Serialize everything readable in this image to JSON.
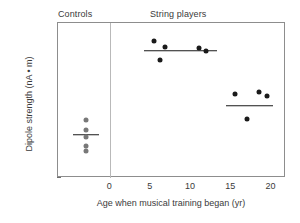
{
  "headers": {
    "controls": "Controls",
    "string_players": "String players"
  },
  "axis": {
    "ylabel": "Dipole strength (nA • m)",
    "xlabel": "Age when musical training began (yr)",
    "yticks": [
      "0",
      "5",
      "10",
      "15",
      "20",
      "25",
      "30"
    ],
    "xticks": [
      "0",
      "5",
      "10",
      "15",
      "20"
    ]
  },
  "chart_data": {
    "type": "scatter",
    "title": "",
    "xlabel": "Age when musical training began (yr)",
    "ylabel": "Dipole strength (nA • m)",
    "xlim": [
      -6.5,
      21.8
    ],
    "ylim": [
      0,
      30
    ],
    "xticks": [
      0,
      5,
      10,
      15,
      20
    ],
    "yticks": [
      0,
      5,
      10,
      15,
      20,
      25,
      30
    ],
    "grid": false,
    "legend": null,
    "group_divider_x": 0,
    "series": [
      {
        "name": "Controls",
        "color": "#787878",
        "points": [
          {
            "x": -3.0,
            "y": 11.2
          },
          {
            "x": -3.0,
            "y": 9.3
          },
          {
            "x": -3.0,
            "y": 8.0
          },
          {
            "x": -3.0,
            "y": 6.2
          },
          {
            "x": -3.0,
            "y": 5.2
          }
        ],
        "mean": 8.4,
        "mean_line_x": [
          -4.6,
          -1.4
        ]
      },
      {
        "name": "String players (early training)",
        "color": "#1a1a1a",
        "points": [
          {
            "x": 5.4,
            "y": 26.5
          },
          {
            "x": 6.8,
            "y": 25.3
          },
          {
            "x": 6.2,
            "y": 22.8
          },
          {
            "x": 11.0,
            "y": 25.1
          },
          {
            "x": 11.9,
            "y": 24.6
          }
        ],
        "mean": 24.6,
        "mean_line_x": [
          4.2,
          13.2
        ]
      },
      {
        "name": "String players (late training)",
        "color": "#1a1a1a",
        "points": [
          {
            "x": 15.5,
            "y": 16.3
          },
          {
            "x": 18.4,
            "y": 16.6
          },
          {
            "x": 19.4,
            "y": 15.9
          },
          {
            "x": 16.9,
            "y": 11.5
          }
        ],
        "mean": 14.0,
        "mean_line_x": [
          14.3,
          20.2
        ]
      }
    ]
  }
}
